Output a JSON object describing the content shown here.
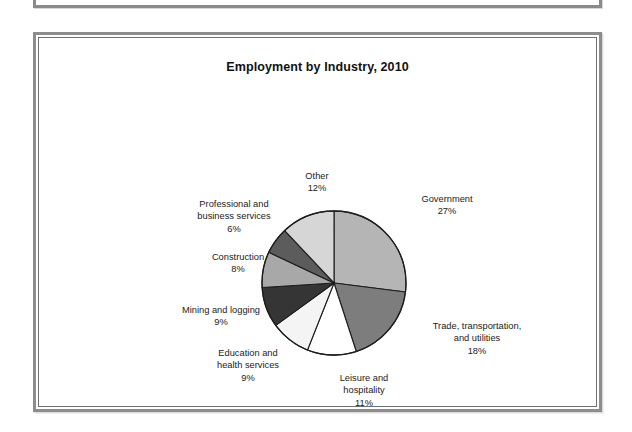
{
  "figure": {
    "title": "Employment by Industry, 2010",
    "frame_color": "#8d8d8d",
    "background": "#ffffff"
  },
  "chart_data": {
    "type": "pie",
    "title": "Employment by Industry, 2010",
    "xlabel": "",
    "ylabel": "",
    "start_angle_deg": 0,
    "direction": "clockwise",
    "legend_position": "none",
    "labels_outside": true,
    "categories": [
      "Government",
      "Trade, transportation, and utilities",
      "Leisure and hospitality",
      "Education and health services",
      "Mining and logging",
      "Construction",
      "Professional and business services",
      "Other"
    ],
    "values": [
      27,
      18,
      11,
      9,
      9,
      8,
      6,
      12
    ],
    "unit": "%",
    "slices": [
      {
        "name": "Government",
        "name_line1": "Government",
        "value": 27,
        "percent_text": "27%",
        "color": "#b5b5b5"
      },
      {
        "name": "Trade, transportation, and utilities",
        "name_line1": "Trade, transportation,",
        "name_line2": "and utilities",
        "value": 18,
        "percent_text": "18%",
        "color": "#7d7d7d"
      },
      {
        "name": "Leisure and hospitality",
        "name_line1": "Leisure and",
        "name_line2": "hospitality",
        "value": 11,
        "percent_text": "11%",
        "color": "#ffffff"
      },
      {
        "name": "Education and health services",
        "name_line1": "Education and",
        "name_line2": "health services",
        "value": 9,
        "percent_text": "9%",
        "color": "#f4f4f4"
      },
      {
        "name": "Mining and logging",
        "name_line1": "Mining and logging",
        "value": 9,
        "percent_text": "9%",
        "color": "#353535"
      },
      {
        "name": "Construction",
        "name_line1": "Construction",
        "value": 8,
        "percent_text": "8%",
        "color": "#a8a8a8"
      },
      {
        "name": "Professional and business services",
        "name_line1": "Professional and",
        "name_line2": "business services",
        "value": 6,
        "percent_text": "6%",
        "color": "#5c5c5c"
      },
      {
        "name": "Other",
        "name_line1": "Other",
        "value": 12,
        "percent_text": "12%",
        "color": "#d6d6d6"
      }
    ]
  }
}
